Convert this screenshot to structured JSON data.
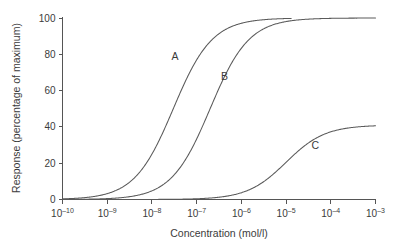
{
  "chart_data": {
    "type": "line",
    "title": "",
    "subtitle": "",
    "xlabel": "Concentration (mol/l)",
    "ylabel": "Response (percentage of maximum)",
    "xscale": "log",
    "xlim": [
      1e-10,
      0.001
    ],
    "ylim": [
      0,
      100
    ],
    "grid": false,
    "legend": "inline-curve-labels",
    "xticks": [
      {
        "value": 1e-10,
        "mantissa": "10",
        "exponent": "–10"
      },
      {
        "value": 1e-09,
        "mantissa": "10",
        "exponent": "–9"
      },
      {
        "value": 1e-08,
        "mantissa": "10",
        "exponent": "–8"
      },
      {
        "value": 1e-07,
        "mantissa": "10",
        "exponent": "–7"
      },
      {
        "value": 1e-06,
        "mantissa": "10",
        "exponent": "–6"
      },
      {
        "value": 1e-05,
        "mantissa": "10",
        "exponent": "–5"
      },
      {
        "value": 0.0001,
        "mantissa": "10",
        "exponent": "–4"
      },
      {
        "value": 0.001,
        "mantissa": "10",
        "exponent": "–3"
      }
    ],
    "yticks": [
      {
        "value": 0,
        "label": "0"
      },
      {
        "value": 20,
        "label": "20"
      },
      {
        "value": 40,
        "label": "40"
      },
      {
        "value": 60,
        "label": "60"
      },
      {
        "value": 80,
        "label": "80"
      },
      {
        "value": 100,
        "label": "100"
      }
    ],
    "series": [
      {
        "name": "A",
        "label": "A",
        "emax": 100,
        "ec50": 3e-08,
        "hill": 1.0,
        "x_start": 1e-10,
        "x_end": 1.3e-05,
        "label_x": 3.3e-08,
        "label_y": 77,
        "points": [
          {
            "x": 1e-10,
            "y": 0.3
          },
          {
            "x": 3.16e-10,
            "y": 1.0
          },
          {
            "x": 1e-09,
            "y": 3.2
          },
          {
            "x": 3.16e-09,
            "y": 9.5
          },
          {
            "x": 1e-08,
            "y": 25.0
          },
          {
            "x": 2e-08,
            "y": 40.0
          },
          {
            "x": 3e-08,
            "y": 50.0
          },
          {
            "x": 5e-08,
            "y": 62.5
          },
          {
            "x": 1e-07,
            "y": 76.9
          },
          {
            "x": 3.16e-07,
            "y": 91.3
          },
          {
            "x": 1e-06,
            "y": 97.1
          },
          {
            "x": 3.16e-06,
            "y": 99.1
          },
          {
            "x": 1e-05,
            "y": 99.7
          },
          {
            "x": 1.3e-05,
            "y": 99.8
          }
        ]
      },
      {
        "name": "B",
        "label": "B",
        "emax": 100,
        "ec50": 2e-07,
        "hill": 1.0,
        "x_start": 1e-10,
        "x_end": 0.001,
        "label_x": 4.2e-07,
        "label_y": 66,
        "points": [
          {
            "x": 1e-10,
            "y": 0.05
          },
          {
            "x": 1e-09,
            "y": 0.5
          },
          {
            "x": 3.16e-09,
            "y": 1.6
          },
          {
            "x": 1e-08,
            "y": 4.8
          },
          {
            "x": 3.16e-08,
            "y": 13.6
          },
          {
            "x": 1e-07,
            "y": 33.3
          },
          {
            "x": 2e-07,
            "y": 50.0
          },
          {
            "x": 4e-07,
            "y": 66.7
          },
          {
            "x": 1e-06,
            "y": 83.3
          },
          {
            "x": 3.16e-06,
            "y": 94.1
          },
          {
            "x": 1e-05,
            "y": 98.0
          },
          {
            "x": 3.16e-05,
            "y": 99.4
          },
          {
            "x": 0.0001,
            "y": 99.8
          },
          {
            "x": 0.001,
            "y": 100.0
          }
        ]
      },
      {
        "name": "C",
        "label": "C",
        "emax": 41,
        "ec50": 1e-05,
        "hill": 1.0,
        "x_start": 1e-10,
        "x_end": 0.001,
        "label_x": 4.5e-05,
        "label_y": 28,
        "points": [
          {
            "x": 1e-10,
            "y": 0.0
          },
          {
            "x": 1e-08,
            "y": 0.04
          },
          {
            "x": 1e-07,
            "y": 0.4
          },
          {
            "x": 3.16e-07,
            "y": 1.3
          },
          {
            "x": 1e-06,
            "y": 3.7
          },
          {
            "x": 3.16e-06,
            "y": 9.8
          },
          {
            "x": 1e-05,
            "y": 20.5
          },
          {
            "x": 3.16e-05,
            "y": 31.2
          },
          {
            "x": 0.0001,
            "y": 37.3
          },
          {
            "x": 0.000316,
            "y": 39.7
          },
          {
            "x": 0.001,
            "y": 40.6
          }
        ]
      }
    ]
  },
  "figure": {
    "background_color": "#ffffff",
    "axis_color": "#555555",
    "curve_color": "#5a5a5a",
    "text_color": "#3b3b3b"
  }
}
